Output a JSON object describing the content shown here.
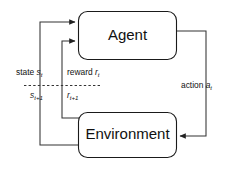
{
  "diagram": {
    "background_color": "#ffffff",
    "stroke_color": "#333333",
    "text_color": "#111111",
    "nodes": [
      {
        "id": "agent",
        "label": "Agent"
      },
      {
        "id": "environment",
        "label": "Environment"
      }
    ],
    "edges": [
      {
        "id": "state",
        "label_word": "state",
        "symbol": "s",
        "subscript": "t",
        "next_symbol": "s",
        "next_subscript": "t+1",
        "from": "environment",
        "to": "agent"
      },
      {
        "id": "reward",
        "label_word": "reward",
        "symbol": "r",
        "subscript": "t",
        "next_symbol": "r",
        "next_subscript": "t+1",
        "from": "environment",
        "to": "agent"
      },
      {
        "id": "action",
        "label_word": "action",
        "symbol": "a",
        "subscript": "t",
        "next_symbol": "",
        "next_subscript": "",
        "from": "agent",
        "to": "environment"
      }
    ]
  }
}
